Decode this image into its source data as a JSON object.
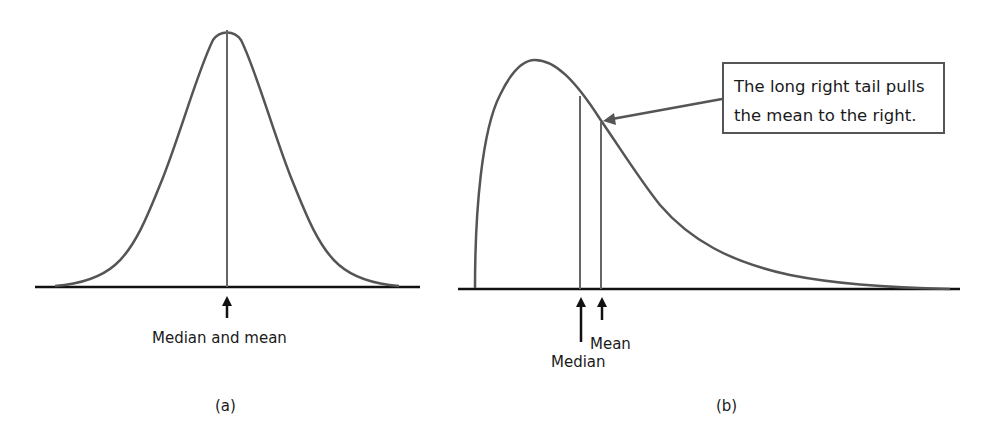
{
  "panels": [
    {
      "id": "a",
      "caption": "(a)",
      "description": "Symmetric distribution",
      "markers": [
        {
          "label": "Median and mean",
          "x": 227
        }
      ]
    },
    {
      "id": "b",
      "caption": "(b)",
      "description": "Right-skewed distribution",
      "markers": [
        {
          "label": "Median",
          "x": 580
        },
        {
          "label": "Mean",
          "x": 601
        }
      ],
      "callout": {
        "line1": "The long right tail pulls",
        "line2": "the mean to the right."
      }
    }
  ],
  "colors": {
    "curve": "#555555",
    "axis": "#111111",
    "arrow": "#111111",
    "callout_border": "#555555"
  }
}
